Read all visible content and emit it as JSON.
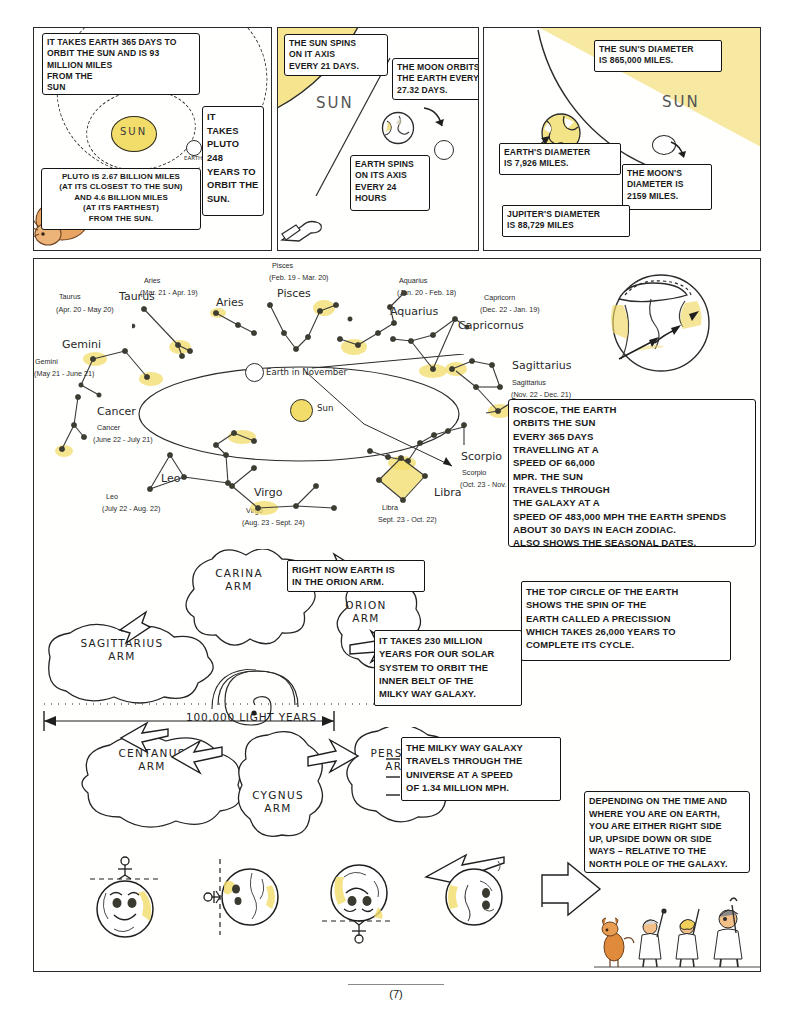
{
  "page": {
    "number_label": "(7)"
  },
  "panels": {
    "panel1": {
      "name": "sun-earth-pluto-orbit-panel",
      "sun_label": "SUN",
      "earth_label": "EARTH",
      "bubbles": [
        {
          "id": "earth-orbit-bubble",
          "text": "IT TAKES EARTH 365 DAYS TO\nORBIT THE SUN AND IS 93\nMILLION MILES\nFROM THE\nSUN"
        },
        {
          "id": "pluto-orbit-bubble",
          "text": "IT\nTAKES\nPLUTO\n248\nYEARS TO\nORBIT THE\nSUN."
        },
        {
          "id": "pluto-distance-bubble",
          "text": "PLUTO IS 2.67 BILLION MILES\n(AT ITS CLOSEST TO THE SUN)\nAND 4.6 BILLION MILES\n(AT ITS FARTHEST)\nFROM THE SUN."
        }
      ]
    },
    "panel2": {
      "name": "sun-spin-moon-orbit-panel",
      "sun_label": "SUN",
      "bubbles": [
        {
          "id": "sun-spin-bubble",
          "text": "THE SUN SPINS\nON IT AXIS\nEVERY 21 DAYS."
        },
        {
          "id": "moon-orbit-bubble",
          "text": "THE MOON ORBITS\nTHE EARTH EVERY\n27.32 DAYS."
        },
        {
          "id": "earth-spin-bubble",
          "text": "EARTH SPINS\nON ITS AXIS\nEVERY 24\nHOURS"
        }
      ]
    },
    "panel3": {
      "name": "diameters-panel",
      "sun_label": "SUN",
      "bubbles": [
        {
          "id": "sun-diameter-bubble",
          "text": "THE SUN'S DIAMETER\nIS 865,000 MILES."
        },
        {
          "id": "earth-diameter-bubble",
          "text": "EARTH'S DIAMETER\nIS 7,926 MILES."
        },
        {
          "id": "moon-diameter-bubble",
          "text": "THE MOON'S\nDIAMETER IS\n2159 MILES."
        },
        {
          "id": "jupiter-diameter-bubble",
          "text": "JUPITER'S DIAMETER\nIS 88,729 MILES"
        }
      ]
    },
    "panel4": {
      "name": "zodiac-and-galaxy-panel",
      "ecliptic": {
        "earth_label": "Earth in November",
        "sun_label": "Sun"
      },
      "zodiac": [
        {
          "name": "Taurus",
          "big": "Taurus",
          "small": "Taurus",
          "dates": "(Apr. 20 - May 20)"
        },
        {
          "name": "Aries",
          "big": "Aries",
          "small": "Aries",
          "dates": "(Mar. 21 - Apr. 19)"
        },
        {
          "name": "Pisces",
          "big": "Pisces",
          "small": "Pisces",
          "dates": "(Feb. 19 - Mar. 20)"
        },
        {
          "name": "Aquarius",
          "big": "Aquarius",
          "small": "Aquarius",
          "dates": "(Jan. 20 - Feb. 18)"
        },
        {
          "name": "Capricornus",
          "big": "Capricornus",
          "small": "Capricorn",
          "dates": "(Dec. 22 - Jan. 19)"
        },
        {
          "name": "Sagittarius",
          "big": "Sagittarius",
          "small": "Sagittarius",
          "dates": "(Nov. 22 - Dec. 21)"
        },
        {
          "name": "Scorpio",
          "big": "Scorpio",
          "small": "Scorpio",
          "dates": "(Oct. 23 - Nov. 21)"
        },
        {
          "name": "Libra",
          "big": "Libra",
          "small": "Libra",
          "dates": "Sept. 23 - Oct. 22)"
        },
        {
          "name": "Virgo",
          "big": "Virgo",
          "small": "Virgo",
          "dates": "(Aug. 23 - Sept. 24)"
        },
        {
          "name": "Leo",
          "big": "Leo",
          "small": "Leo",
          "dates": "(July 22 - Aug. 22)"
        },
        {
          "name": "Cancer",
          "big": "Cancer",
          "small": "Cancer",
          "dates": "(June 22 - July 21)"
        },
        {
          "name": "Gemini",
          "big": "Gemini",
          "small": "Gemini",
          "dates": "(May 21 - June 21)"
        }
      ],
      "bubbles": [
        {
          "id": "roscoe-bubble",
          "text": "ROSCOE, THE EARTH\nORBITS THE SUN\nEVERY 365 DAYS\nTRAVELLING AT A\nSPEED OF 66,000\nMPR. THE SUN\nTRAVELS THROUGH\nTHE GALAXY AT A\nSPEED OF 483,000 MPH THE EARTH SPENDS\nABOUT 30 DAYS IN EACH ZODIAC.\nALSO SHOWS THE SEASONAL DATES."
        },
        {
          "id": "precession-bubble",
          "text": "THE TOP CIRCLE OF THE EARTH\nSHOWS THE SPIN OF THE\nEARTH CALLED A PRECISSION\nWHICH TAKES 26,000 YEARS TO\nCOMPLETE ITS CYCLE."
        },
        {
          "id": "orion-arm-bubble",
          "text": "RIGHT NOW EARTH IS\nIN THE ORION ARM."
        },
        {
          "id": "solar-orbit-bubble",
          "text": "IT TAKES 230 MILLION\nYEARS FOR OUR SOLAR\nSYSTEM TO ORBIT THE\nINNER BELT OF THE\nMILKY WAY GALAXY."
        },
        {
          "id": "galaxy-speed-bubble",
          "text": "THE MILKY WAY GALAXY\nTRAVELS THROUGH THE\nUNIVERSE AT A SPEED\nOF 1.34 MILLION MPH."
        },
        {
          "id": "orientation-bubble",
          "text": "DEPENDING ON THE TIME AND\nWHERE YOU ARE ON EARTH,\nYOU ARE EITHER RIGHT SIDE\nUP, UPSIDE DOWN OR SIDE\nWAYS – RELATIVE TO THE\nNORTH POLE OF THE GALAXY."
        }
      ],
      "galaxy_arms": [
        {
          "id": "carina-arm",
          "label": "CARINA\nARM"
        },
        {
          "id": "orion-arm",
          "label": "ORION\nARM"
        },
        {
          "id": "sagittarius-arm",
          "label": "SAGITTARIUS\nARM"
        },
        {
          "id": "centanus-arm",
          "label": "CENTANUS\nARM"
        },
        {
          "id": "cygnus-arm",
          "label": "CYGNUS\nARM"
        },
        {
          "id": "perseus-arm",
          "label": "PERSEUS\nARM"
        }
      ],
      "scale_label": "100,000 LIGHT YEARS"
    }
  },
  "colors": {
    "sun_yellow": "#f2dc6a",
    "ink": "#1f1f1f",
    "dog_orange": "#e08a3c",
    "paper": "#ffffff"
  }
}
